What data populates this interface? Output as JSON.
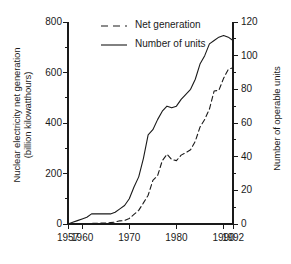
{
  "chart_data": {
    "type": "line",
    "title": "",
    "subtitle": "",
    "xlabel": "",
    "ylabel": "Nuclear electricity net generation (billion kilowatthours)",
    "ylabel_right": "Number of operable units",
    "grid": false,
    "legend_position": "top-left-inside",
    "xlim": [
      1957,
      1992
    ],
    "ylim": [
      0,
      800
    ],
    "ylim_right": [
      0,
      120
    ],
    "xticks": [
      1957,
      1960,
      1970,
      1980,
      1990,
      1992
    ],
    "xtick_labels": [
      "1957",
      "1960",
      "1970",
      "1980",
      "1990",
      "1992"
    ],
    "yticks_left": [
      0,
      200,
      400,
      600,
      800
    ],
    "ytick_labels_left": [
      "0",
      "200",
      "400",
      "600",
      "800"
    ],
    "yticks_left_minor": [
      100,
      300,
      500,
      700
    ],
    "yticks_right": [
      0,
      20,
      40,
      60,
      80,
      100,
      120
    ],
    "ytick_labels_right": [
      "0",
      "20",
      "40",
      "60",
      "80",
      "100",
      "120"
    ],
    "yticks_right_minor": [
      10,
      30,
      50,
      70,
      90,
      110
    ],
    "series": [
      {
        "name": "Net generation",
        "axis": "left",
        "style": "dashed",
        "color": "#1a1a1a",
        "units": "billion kilowatthours",
        "x": [
          1957,
          1958,
          1959,
          1960,
          1961,
          1962,
          1963,
          1964,
          1965,
          1966,
          1967,
          1968,
          1969,
          1970,
          1971,
          1972,
          1973,
          1974,
          1975,
          1976,
          1977,
          1978,
          1979,
          1980,
          1981,
          1982,
          1983,
          1984,
          1985,
          1986,
          1987,
          1988,
          1989,
          1990,
          1991,
          1992
        ],
        "values": [
          0.1,
          0.2,
          0.2,
          0.5,
          1.7,
          2.3,
          3.2,
          3.3,
          3.7,
          5.5,
          7.7,
          12.5,
          13.9,
          21.8,
          38.1,
          54.1,
          83.5,
          114.0,
          172.5,
          191.1,
          250.9,
          276.4,
          255.2,
          251.1,
          272.7,
          282.8,
          293.7,
          327.6,
          383.7,
          414.0,
          455.3,
          527.0,
          529.4,
          576.9,
          612.6,
          618.8
        ]
      },
      {
        "name": "Number of units",
        "axis": "right",
        "style": "solid",
        "color": "#1a1a1a",
        "units": "operable units",
        "x": [
          1957,
          1958,
          1959,
          1960,
          1961,
          1962,
          1963,
          1964,
          1965,
          1966,
          1967,
          1968,
          1969,
          1970,
          1971,
          1972,
          1973,
          1974,
          1975,
          1976,
          1977,
          1978,
          1979,
          1980,
          1981,
          1982,
          1983,
          1984,
          1985,
          1986,
          1987,
          1988,
          1989,
          1990,
          1991,
          1992
        ],
        "values": [
          0,
          1,
          2,
          3,
          4,
          6,
          6,
          6,
          6,
          6,
          7,
          9,
          11,
          15,
          22,
          28,
          39,
          53,
          56,
          62,
          67,
          70,
          69,
          70,
          74,
          77,
          80,
          86,
          95,
          100,
          107,
          109,
          111,
          112,
          111,
          109
        ]
      }
    ],
    "legend": [
      {
        "label": "Net generation",
        "style": "dashed"
      },
      {
        "label": "Number of units",
        "style": "solid"
      }
    ]
  },
  "axis_titles": {
    "left": "Nuclear electricity net generation (billion kilowatthours)",
    "left_line1": "Nuclear electricity net generation",
    "left_line2": "(billion kilowatthours)",
    "right": "Number  of  operable  units"
  }
}
